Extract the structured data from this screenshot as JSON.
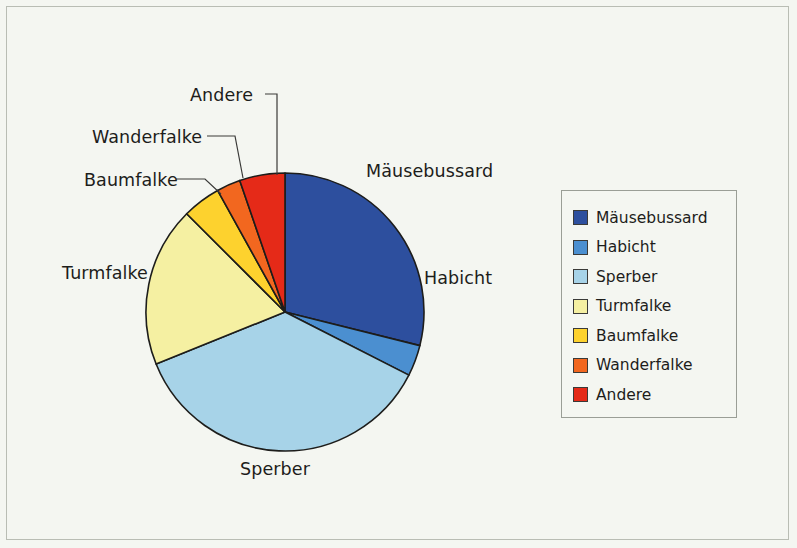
{
  "chart_data": {
    "type": "pie",
    "title": "",
    "subtitle": "",
    "xlabel": "",
    "ylabel": "",
    "grid": false,
    "legend_position": "right",
    "center": {
      "x": 285,
      "y": 312
    },
    "radius": 139,
    "start_angle_deg": 0,
    "direction": "clockwise",
    "categories": [
      "Mäusebussard",
      "Habicht",
      "Sperber",
      "Turmfalke",
      "Baumfalke",
      "Wanderfalke",
      "Andere"
    ],
    "values": [
      29.0,
      3.5,
      36.0,
      18.5,
      4.5,
      3.0,
      5.5
    ],
    "value_unit": "%",
    "colors": [
      "#2d4f9e",
      "#4b8fd0",
      "#a7d3e8",
      "#f5f0a2",
      "#fdd22e",
      "#f2671f",
      "#e52a18"
    ],
    "slices": [
      {
        "label": "Mäusebussard",
        "value": 29.0,
        "color": "#2d4f9e",
        "start_deg": 0.0,
        "end_deg": 104.0
      },
      {
        "label": "Habicht",
        "value": 3.5,
        "color": "#4b8fd0",
        "start_deg": 104.0,
        "end_deg": 117.0
      },
      {
        "label": "Sperber",
        "value": 36.0,
        "color": "#a7d3e8",
        "start_deg": 117.0,
        "end_deg": 248.0
      },
      {
        "label": "Turmfalke",
        "value": 18.5,
        "color": "#f5f0a2",
        "start_deg": 248.0,
        "end_deg": 315.0
      },
      {
        "label": "Baumfalke",
        "value": 4.5,
        "color": "#fdd22e",
        "start_deg": 315.0,
        "end_deg": 331.0
      },
      {
        "label": "Wanderfalke",
        "value": 3.0,
        "color": "#f2671f",
        "start_deg": 331.0,
        "end_deg": 341.0
      },
      {
        "label": "Andere",
        "value": 5.5,
        "color": "#e52a18",
        "start_deg": 341.0,
        "end_deg": 360.0
      }
    ]
  },
  "labels": {
    "mausebussard": "Mäusebussard",
    "habicht": "Habicht",
    "sperber": "Sperber",
    "turmfalke": "Turmfalke",
    "baumfalke": "Baumfalke",
    "wanderfalke": "Wanderfalke",
    "andere": "Andere"
  },
  "legend": {
    "items": [
      {
        "label": "Mäusebussard",
        "color": "#2d4f9e"
      },
      {
        "label": "Habicht",
        "color": "#4b8fd0"
      },
      {
        "label": "Sperber",
        "color": "#a7d3e8"
      },
      {
        "label": "Turmfalke",
        "color": "#f5f0a2"
      },
      {
        "label": "Baumfalke",
        "color": "#fdd22e"
      },
      {
        "label": "Wanderfalke",
        "color": "#f2671f"
      },
      {
        "label": "Andere",
        "color": "#e52a18"
      }
    ]
  },
  "style": {
    "background": "#f4f6f1",
    "frame_border": "#b9bdb4",
    "slice_outline": "#1d1d1b",
    "leader_line": "#3a3a38",
    "text": "#1d1d1b"
  }
}
